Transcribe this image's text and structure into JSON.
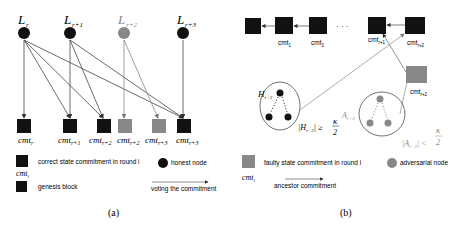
{
  "panel_a": {
    "caption": "(a)",
    "leaders": [
      {
        "label": "L",
        "sub": "r",
        "color": "#111111"
      },
      {
        "label": "L",
        "sub": "r+1",
        "color": "#111111"
      },
      {
        "label": "L",
        "sub": "r+2",
        "color": "#888888"
      },
      {
        "label": "L",
        "sub": "r+3",
        "color": "#111111"
      }
    ],
    "commitments": [
      {
        "label": "cmt",
        "sub": "r",
        "color": "#111111"
      },
      {
        "label": "cmt",
        "sub": "r+1",
        "color": "#111111"
      },
      {
        "label": "cmt",
        "sub": "r+2",
        "color": "#111111"
      },
      {
        "label": "cmt",
        "sub": "r+2",
        "color": "#888888"
      },
      {
        "label": "cmt",
        "sub": "r+3",
        "color": "#888888"
      },
      {
        "label": "cmt",
        "sub": "r+3",
        "color": "#111111"
      }
    ],
    "legend": {
      "correct": "correct state commitment in round i",
      "cmt_i": "cmt",
      "cmt_i_sub": "i",
      "genesis": "genesis block",
      "honest": "honest node",
      "voting": "voting the commitment"
    }
  },
  "panel_b": {
    "caption": "(b)",
    "chain": [
      {
        "label": ""
      },
      {
        "label": "cmt",
        "sub": "1"
      },
      {
        "label": "cmt",
        "sub": "2"
      },
      {
        "label": "cmt",
        "sub": "r+1"
      },
      {
        "label": "cmt",
        "sub": "r+2"
      }
    ],
    "ellipsis": "· · ·",
    "faulty_block": {
      "label": "cmt",
      "sub": "r+2"
    },
    "honest_set": {
      "label": "H",
      "sub": "r+2",
      "condition": "|H",
      "cond_sub": "r+2",
      "cond_op": "| ≥",
      "kappa": "κ",
      "den": "2"
    },
    "adversary_set": {
      "label": "A",
      "sub": "r+2",
      "condition": "|A",
      "cond_sub": "r+2",
      "cond_op": "| <",
      "kappa": "κ",
      "den": "2"
    },
    "legend": {
      "faulty": "faulty state commitment in round i",
      "cmt_i": "cmt",
      "cmt_i_sub": "i",
      "adversarial": "adversarial node",
      "ancestor": "ancestor commitment"
    }
  }
}
